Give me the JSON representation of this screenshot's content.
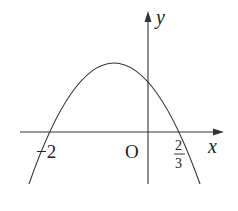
{
  "diagram": {
    "axes": {
      "x_label": "x",
      "y_label": "y",
      "origin_label": "O"
    },
    "intercepts": {
      "left": "−2",
      "right_numerator": "2",
      "right_denominator": "3"
    },
    "colors": {
      "stroke": "#333333",
      "background": "#ffffff"
    }
  }
}
